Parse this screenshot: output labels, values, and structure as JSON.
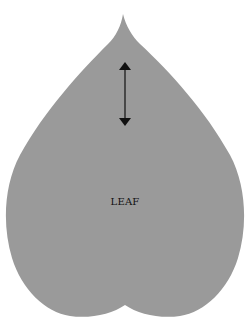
{
  "diagram": {
    "shape": "heart-shaped leaf",
    "fill_color": "#9a9a9a",
    "background_color": "#ffffff",
    "label": "LEAF",
    "arrow": {
      "type": "double-headed vertical arrow",
      "color": "#111111"
    }
  }
}
